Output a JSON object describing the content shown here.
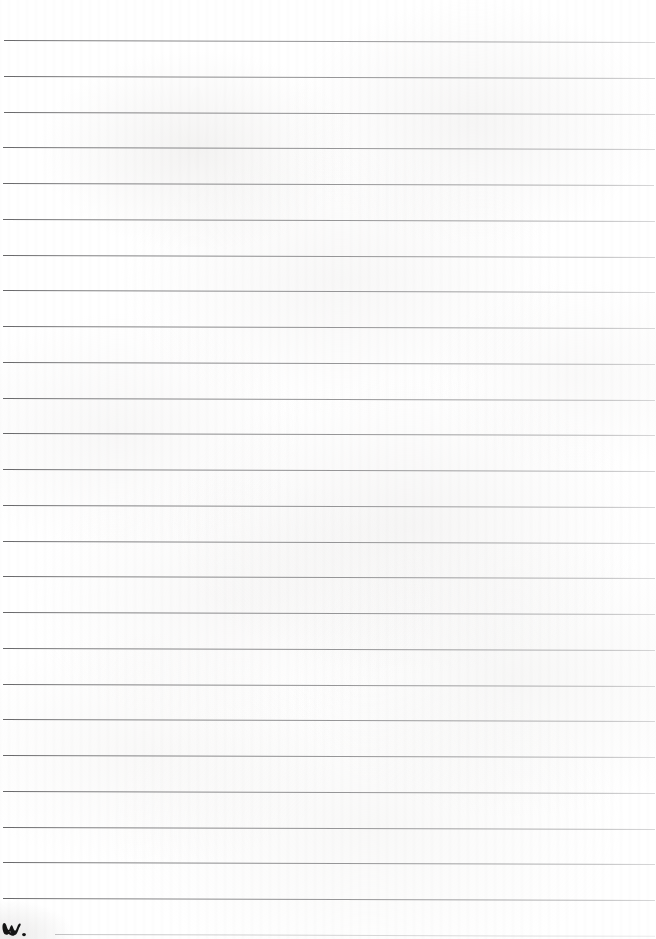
{
  "document": {
    "kind": "scanned-lined-notebook-page",
    "title": "Blank ruled notebook page (scan)",
    "page_width": 656,
    "page_height": 939,
    "body_text": "",
    "paper_color": "#ffffff",
    "rule_color": "#78787a",
    "rule_color_faint": "#a0a0a2",
    "ink_color": "#1a1a1a"
  },
  "ruling": {
    "line_count": 26,
    "first_line_y": 40,
    "line_spacing": 35.8,
    "line_thickness": 1,
    "left_inset": 3,
    "right_inset": 2,
    "slope_px": 2,
    "lines": [
      {
        "index": 1,
        "y": 40,
        "x_start": 4,
        "x_end": 655,
        "faint": false
      },
      {
        "index": 2,
        "y": 76,
        "x_start": 4,
        "x_end": 655,
        "faint": false
      },
      {
        "index": 3,
        "y": 112,
        "x_start": 4,
        "x_end": 655,
        "faint": false
      },
      {
        "index": 4,
        "y": 147,
        "x_start": 3,
        "x_end": 655,
        "faint": false
      },
      {
        "index": 5,
        "y": 183,
        "x_start": 3,
        "x_end": 654,
        "faint": false
      },
      {
        "index": 6,
        "y": 219,
        "x_start": 3,
        "x_end": 655,
        "faint": false
      },
      {
        "index": 7,
        "y": 255,
        "x_start": 3,
        "x_end": 655,
        "faint": false
      },
      {
        "index": 8,
        "y": 290,
        "x_start": 3,
        "x_end": 655,
        "faint": false
      },
      {
        "index": 9,
        "y": 326,
        "x_start": 3,
        "x_end": 655,
        "faint": false
      },
      {
        "index": 10,
        "y": 362,
        "x_start": 3,
        "x_end": 655,
        "faint": false
      },
      {
        "index": 11,
        "y": 398,
        "x_start": 3,
        "x_end": 655,
        "faint": false
      },
      {
        "index": 12,
        "y": 433,
        "x_start": 3,
        "x_end": 655,
        "faint": false
      },
      {
        "index": 13,
        "y": 469,
        "x_start": 3,
        "x_end": 655,
        "faint": false
      },
      {
        "index": 14,
        "y": 505,
        "x_start": 3,
        "x_end": 655,
        "faint": false
      },
      {
        "index": 15,
        "y": 541,
        "x_start": 3,
        "x_end": 655,
        "faint": false
      },
      {
        "index": 16,
        "y": 576,
        "x_start": 3,
        "x_end": 655,
        "faint": false
      },
      {
        "index": 17,
        "y": 612,
        "x_start": 3,
        "x_end": 655,
        "faint": false
      },
      {
        "index": 18,
        "y": 648,
        "x_start": 3,
        "x_end": 655,
        "faint": false
      },
      {
        "index": 19,
        "y": 684,
        "x_start": 3,
        "x_end": 655,
        "faint": false
      },
      {
        "index": 20,
        "y": 719,
        "x_start": 3,
        "x_end": 655,
        "faint": false
      },
      {
        "index": 21,
        "y": 755,
        "x_start": 3,
        "x_end": 655,
        "faint": false
      },
      {
        "index": 22,
        "y": 791,
        "x_start": 3,
        "x_end": 655,
        "faint": false
      },
      {
        "index": 23,
        "y": 827,
        "x_start": 3,
        "x_end": 655,
        "faint": false
      },
      {
        "index": 24,
        "y": 862,
        "x_start": 3,
        "x_end": 655,
        "faint": false
      },
      {
        "index": 25,
        "y": 898,
        "x_start": 3,
        "x_end": 655,
        "faint": false
      },
      {
        "index": 26,
        "y": 934,
        "x_start": 55,
        "x_end": 655,
        "faint": true
      }
    ]
  },
  "marks": [
    {
      "name": "ink-mark",
      "description": "small dark handwritten ink mark resembling a w with a dot",
      "x": 2,
      "y": 921,
      "width": 24,
      "height": 16
    }
  ]
}
